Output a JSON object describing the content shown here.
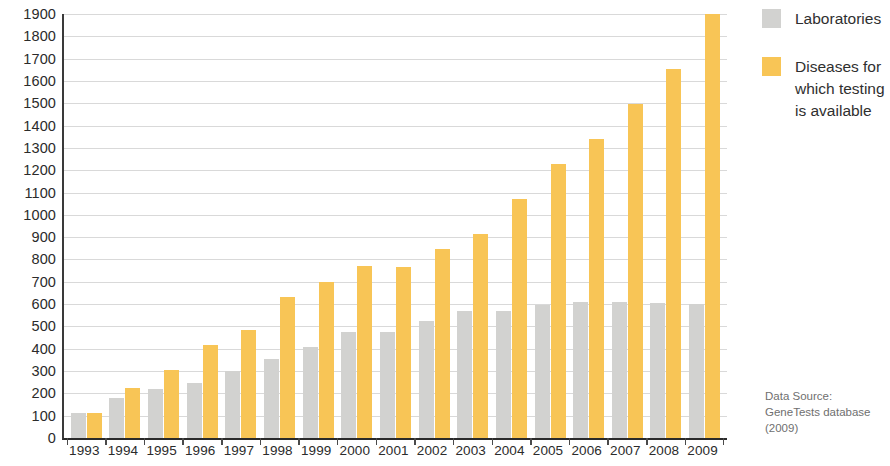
{
  "chart_data": {
    "type": "bar",
    "title": "",
    "subtitle": "",
    "xlabel": "",
    "ylabel": "",
    "ylim": [
      0,
      1900
    ],
    "ytick_step": 100,
    "grid": true,
    "legend_position": "right",
    "categories": [
      "1993",
      "1994",
      "1995",
      "1996",
      "1997",
      "1998",
      "1999",
      "2000",
      "2001",
      "2002",
      "2003",
      "2004",
      "2005",
      "2006",
      "2007",
      "2008",
      "2009"
    ],
    "yticks": [
      "1900",
      "1800",
      "1700",
      "1600",
      "1500",
      "1400",
      "1300",
      "1200",
      "1100",
      "1000",
      "900",
      "800",
      "700",
      "600",
      "500",
      "400",
      "300",
      "200",
      "100",
      "0"
    ],
    "series": [
      {
        "name": "Laboratories",
        "color": "#d2d2d0",
        "values": [
          110,
          180,
          220,
          245,
          300,
          355,
          410,
          475,
          475,
          525,
          570,
          570,
          598,
          608,
          608,
          605,
          600
        ]
      },
      {
        "name": "Diseases for which testing is available",
        "color": "#f8c556",
        "values": [
          110,
          225,
          305,
          418,
          485,
          630,
          700,
          770,
          765,
          845,
          915,
          1070,
          1230,
          1340,
          1495,
          1655,
          1900
        ]
      }
    ],
    "annotations": {
      "source": "Data Source: GeneTests database (2009)"
    }
  },
  "legend": {
    "items": [
      {
        "label": "Laboratories",
        "swatch": "labs"
      },
      {
        "label": "Diseases for which testing is available",
        "swatch": "diseases"
      }
    ]
  },
  "source_note": {
    "line1": "Data Source:",
    "line2": "GeneTests database",
    "line3": "(2009)"
  }
}
